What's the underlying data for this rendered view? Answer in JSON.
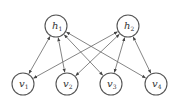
{
  "diagram": {
    "type": "bipartite-graph",
    "hidden_nodes": [
      {
        "id": "h1",
        "base": "h",
        "sub": "1",
        "x": 56,
        "y": 26
      },
      {
        "id": "h2",
        "base": "h",
        "sub": "2",
        "x": 128,
        "y": 26
      }
    ],
    "visible_nodes": [
      {
        "id": "v1",
        "base": "v",
        "sub": "1",
        "x": 23,
        "y": 84
      },
      {
        "id": "v2",
        "base": "v",
        "sub": "2",
        "x": 67,
        "y": 84
      },
      {
        "id": "v3",
        "base": "v",
        "sub": "3",
        "x": 111,
        "y": 84
      },
      {
        "id": "v4",
        "base": "v",
        "sub": "4",
        "x": 156,
        "y": 84
      }
    ],
    "edges": [
      [
        "h1",
        "v1"
      ],
      [
        "h1",
        "v2"
      ],
      [
        "h1",
        "v3"
      ],
      [
        "h1",
        "v4"
      ],
      [
        "h2",
        "v1"
      ],
      [
        "h2",
        "v2"
      ],
      [
        "h2",
        "v3"
      ],
      [
        "h2",
        "v4"
      ]
    ],
    "edge_style": "bidirectional-arrow",
    "colors": {
      "stroke": "#555555",
      "edge": "#666666",
      "background": "#ffffff"
    }
  }
}
